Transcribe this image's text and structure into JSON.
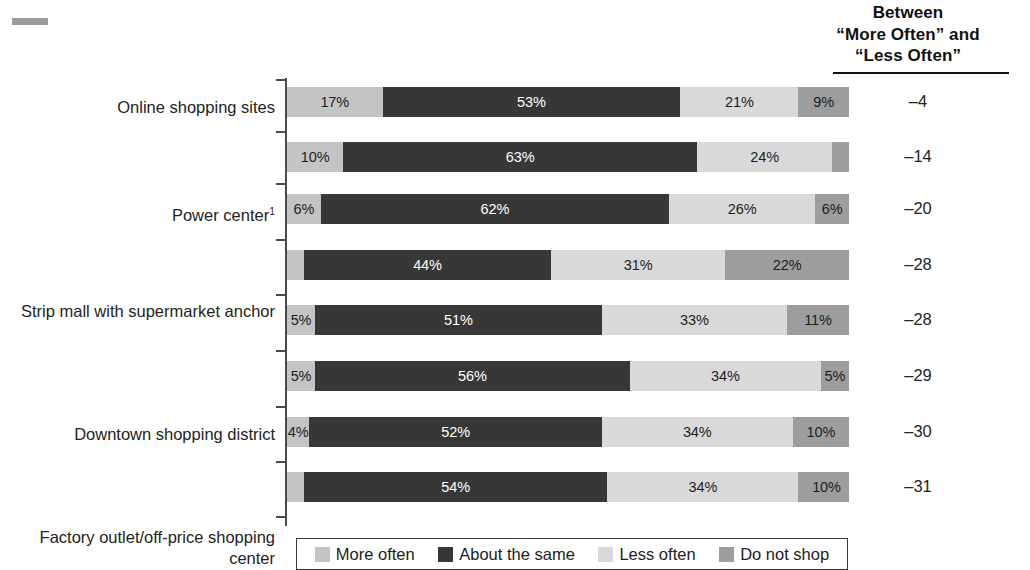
{
  "header": {
    "line1": "Between",
    "line2": "“More Often” and",
    "line3": "“Less Often”"
  },
  "legend": {
    "items": [
      {
        "label": "More often",
        "color": "#c4c4c4",
        "key": "more"
      },
      {
        "label": "About the same",
        "color": "#373737",
        "key": "same"
      },
      {
        "label": "Less often",
        "color": "#d9d9d9",
        "key": "less"
      },
      {
        "label": "Do not shop",
        "color": "#9d9d9d",
        "key": "noshop"
      }
    ]
  },
  "rows": [
    {
      "label": "Online shopping sites",
      "sup": "",
      "more": "17%",
      "same": "53%",
      "less": "21%",
      "noshop": "9%",
      "diff": "–4"
    },
    {
      "label": "Power center",
      "sup": "1",
      "more": "10%",
      "same": "63%",
      "less": "24%",
      "noshop": "3%",
      "diff": "–14"
    },
    {
      "label": "Strip mall with supermarket anchor",
      "sup": "",
      "more": "6%",
      "same": "62%",
      "less": "26%",
      "noshop": "6%",
      "diff": "–20"
    },
    {
      "label": "Downtown shopping district",
      "sup": "",
      "more": "3%",
      "same": "44%",
      "less": "31%",
      "noshop": "22%",
      "diff": "–28"
    },
    {
      "label": "Factory outlet/off-price shopping center",
      "sup": "",
      "more": "5%",
      "same": "51%",
      "less": "33%",
      "noshop": "11%",
      "diff": "–28"
    },
    {
      "label": "Regional mall",
      "sup": "2",
      "more": "5%",
      "same": "56%",
      "less": "34%",
      "noshop": "5%",
      "diff": "–29"
    },
    {
      "label": "Lifestyle center",
      "sup": "3",
      "more": "4%",
      "same": "52%",
      "less": "34%",
      "noshop": "10%",
      "diff": "–30"
    },
    {
      "label": "Small strip mall with specialty stores",
      "sup": "",
      "more": "3%",
      "same": "54%",
      "less": "34%",
      "noshop": "10%",
      "diff": "–31"
    }
  ],
  "chart_data": {
    "type": "bar",
    "title": "",
    "subtitle": "",
    "orientation": "horizontal",
    "stacked": true,
    "stack_total": 100,
    "xlabel": "",
    "ylabel": "",
    "xlim": [
      0,
      100
    ],
    "grid": false,
    "legend_position": "bottom",
    "value_suffix": "%",
    "extra_column_header": "Between “More Often” and “Less Often”",
    "categories": [
      "Online shopping sites",
      "Power center",
      "Strip mall with supermarket anchor",
      "Downtown shopping district",
      "Factory outlet/off-price shopping center",
      "Regional mall",
      "Lifestyle center",
      "Small strip mall with specialty stores"
    ],
    "series": [
      {
        "name": "More often",
        "color": "#c4c4c4",
        "values": [
          17,
          10,
          6,
          3,
          5,
          5,
          4,
          3
        ]
      },
      {
        "name": "About the same",
        "color": "#373737",
        "values": [
          53,
          63,
          62,
          44,
          51,
          56,
          52,
          54
        ]
      },
      {
        "name": "Less often",
        "color": "#d9d9d9",
        "values": [
          21,
          24,
          26,
          31,
          33,
          34,
          34,
          34
        ]
      },
      {
        "name": "Do not shop",
        "color": "#9d9d9d",
        "values": [
          9,
          3,
          6,
          22,
          11,
          5,
          10,
          10
        ]
      }
    ],
    "difference_column": {
      "name": "Between “More Often” and “Less Often”",
      "values": [
        -4,
        -14,
        -20,
        -28,
        -28,
        -29,
        -30,
        -31
      ]
    },
    "footnote_markers": {
      "Power center": "1",
      "Regional mall": "2",
      "Lifestyle center": "3"
    }
  }
}
